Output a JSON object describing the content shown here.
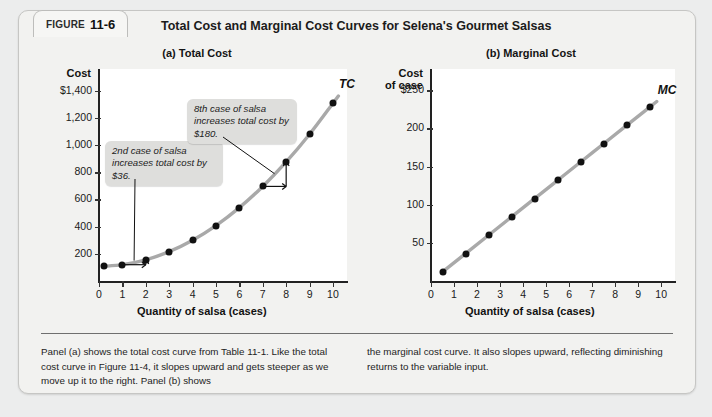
{
  "figure": {
    "tab_label": "FIGURE",
    "tab_number": "11-6",
    "title": "Total Cost and Marginal Cost Curves for Selena's Gourmet Salsas"
  },
  "caption": {
    "left": "Panel (a) shows the total cost curve from Table 11-1. Like the total cost curve in Figure 11-4, it slopes upward and gets steeper as we move up it to the right. Panel (b) shows",
    "right": "the marginal cost curve. It also slopes upward, reflecting diminishing returns to the variable input."
  },
  "colors": {
    "curve": "#a9a9a9",
    "dot": "#111111",
    "callout_bg": "#dededc",
    "panel_bg": "#ffffff",
    "card_bg": "#f2f2f0"
  },
  "chart_data": [
    {
      "type": "scatter",
      "title": "(a) Total Cost",
      "panel": "a",
      "xlabel": "Quantity of salsa (cases)",
      "ylabel": "Cost",
      "series_label": "TC",
      "xlim": [
        0,
        10.6
      ],
      "ylim": [
        0,
        1560
      ],
      "xticks": [
        "0",
        "1",
        "2",
        "3",
        "4",
        "5",
        "6",
        "7",
        "8",
        "9",
        "10"
      ],
      "yticks": [
        "200",
        "400",
        "600",
        "800",
        "1,000",
        "1,200",
        "$1,400"
      ],
      "ytick_values": [
        200,
        400,
        600,
        800,
        1000,
        1200,
        1400
      ],
      "grid": false,
      "x": [
        0.2,
        1,
        2,
        3,
        4,
        5,
        6,
        7,
        8,
        9,
        10
      ],
      "values": [
        108,
        120,
        156,
        216,
        300,
        408,
        540,
        696,
        876,
        1080,
        1308
      ],
      "annotations": [
        {
          "text": "2nd case of salsa increases total cost by $36.",
          "target_x": 1.5,
          "target_y": 150
        },
        {
          "text": "8th case of salsa increases total cost by $180.",
          "target_x": 7.5,
          "target_y": 790
        }
      ],
      "step_markers": [
        {
          "from_x": 1,
          "to_x": 2,
          "y": 120
        },
        {
          "from_x": 7,
          "to_x": 8,
          "y": 696
        }
      ]
    },
    {
      "type": "scatter",
      "title": "(b) Marginal Cost",
      "panel": "b",
      "xlabel": "Quantity of salsa (cases)",
      "ylabel": "Cost of case",
      "series_label": "MC",
      "xlim": [
        0,
        10.6
      ],
      "ylim": [
        0,
        278
      ],
      "xticks": [
        "0",
        "1",
        "2",
        "3",
        "4",
        "5",
        "6",
        "7",
        "8",
        "9",
        "10"
      ],
      "yticks": [
        "50",
        "100",
        "150",
        "200",
        "$250"
      ],
      "ytick_values": [
        50,
        100,
        150,
        200,
        250
      ],
      "grid": false,
      "x": [
        0.5,
        1.5,
        2.5,
        3.5,
        4.5,
        5.5,
        6.5,
        7.5,
        8.5,
        9.5
      ],
      "values": [
        12,
        36,
        60,
        84,
        108,
        132,
        156,
        180,
        204,
        228
      ]
    }
  ]
}
